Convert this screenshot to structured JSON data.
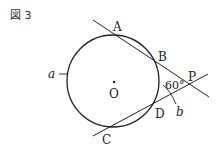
{
  "figure": {
    "title": "図 3",
    "points": {
      "A": "A",
      "B": "B",
      "C": "C",
      "D": "D",
      "P": "P",
      "O": "O"
    },
    "arc_labels": {
      "a": "a",
      "b": "b"
    },
    "angle_label": "60°"
  }
}
